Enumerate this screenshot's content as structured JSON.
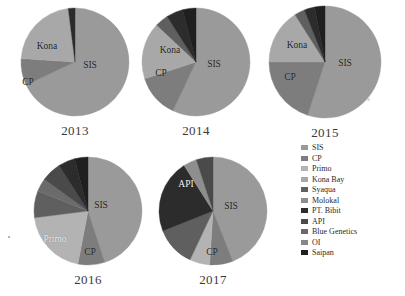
{
  "figure": {
    "kind": "pie-chart-panel",
    "background": "#ffffff"
  },
  "legend": {
    "position": "right",
    "items": [
      {
        "label": "SIS",
        "color": "#9a9a9a"
      },
      {
        "label": "CP",
        "color": "#7d7d7d"
      },
      {
        "label": "Primo",
        "color": "#b3b3b3"
      },
      {
        "label": "Kona Bay",
        "color": "#a8a8a8"
      },
      {
        "label": "Syaqua",
        "color": "#5f5f5f"
      },
      {
        "label": "Molokal",
        "color": "#8e8e8e"
      },
      {
        "label": "PT. Bibit",
        "color": "#2c2c2c"
      },
      {
        "label": "API",
        "color": "#4a4a4a"
      },
      {
        "label": "Blue Genetics",
        "color": "#6b6b6b"
      },
      {
        "label": "OI",
        "color": "#868686"
      },
      {
        "label": "Saipan",
        "color": "#1f1f1f"
      }
    ]
  },
  "chart_data": [
    {
      "type": "pie",
      "title": "2013",
      "categories": [
        "SIS",
        "CP",
        "Primo",
        "Kona Bay",
        "Syaqua",
        "Molokal",
        "PT. Bibit",
        "API",
        "Blue Genetics",
        "OI",
        "Saipan"
      ],
      "values": [
        68,
        8,
        0,
        22,
        0,
        0,
        2,
        0,
        0,
        0,
        0
      ],
      "unit": "percent",
      "labels_shown": [
        "SIS",
        "Kona",
        "CP"
      ],
      "legend": "shared"
    },
    {
      "type": "pie",
      "title": "2014",
      "categories": [
        "SIS",
        "CP",
        "Primo",
        "Kona Bay",
        "Syaqua",
        "Molokal",
        "PT. Bibit",
        "API",
        "Blue Genetics",
        "OI",
        "Saipan"
      ],
      "values": [
        57,
        13,
        0,
        17,
        4,
        0,
        5,
        0,
        0,
        0,
        4
      ],
      "unit": "percent",
      "labels_shown": [
        "SIS",
        "Kona",
        "CP"
      ],
      "legend": "shared"
    },
    {
      "type": "pie",
      "title": "2015",
      "categories": [
        "SIS",
        "CP",
        "Primo",
        "Kona Bay",
        "Syaqua",
        "Molokal",
        "PT. Bibit",
        "API",
        "Blue Genetics",
        "OI",
        "Saipan"
      ],
      "values": [
        55,
        20,
        0,
        16,
        3,
        0,
        3,
        0,
        0,
        0,
        3
      ],
      "unit": "percent",
      "labels_shown": [
        "SIS",
        "Kona",
        "CP"
      ],
      "legend": "shared"
    },
    {
      "type": "pie",
      "title": "2016",
      "categories": [
        "SIS",
        "CP",
        "Primo",
        "Kona Bay",
        "Syaqua",
        "Molokal",
        "PT. Bibit",
        "API",
        "Blue Genetics",
        "OI",
        "Saipan"
      ],
      "values": [
        45,
        8,
        20,
        0,
        8,
        0,
        5,
        6,
        4,
        0,
        4
      ],
      "unit": "percent",
      "labels_shown": [
        "SIS",
        "Primo",
        "CP"
      ],
      "legend": "shared"
    },
    {
      "type": "pie",
      "title": "2017",
      "categories": [
        "SIS",
        "CP",
        "Primo",
        "Kona Bay",
        "Syaqua",
        "Molokal",
        "PT. Bibit",
        "API",
        "Blue Genetics",
        "OI",
        "Saipan"
      ],
      "values": [
        44,
        7,
        6,
        0,
        12,
        0,
        4,
        22,
        0,
        0,
        5
      ],
      "unit": "percent",
      "labels_shown": [
        "SIS",
        "API",
        "CP"
      ],
      "legend": "shared"
    }
  ],
  "panels": [
    {
      "year": "2013",
      "cx": 75,
      "cy": 62,
      "r": 54,
      "start_angle": -90,
      "slices": [
        {
          "name": "SIS",
          "value": 68,
          "color": "#9a9a9a"
        },
        {
          "name": "CP",
          "value": 8,
          "color": "#7d7d7d"
        },
        {
          "name": "Kona Bay",
          "value": 22,
          "color": "#a8a8a8"
        },
        {
          "name": "PT. Bibit",
          "value": 2,
          "color": "#2c2c2c"
        }
      ],
      "annotations": [
        {
          "text": "SIS",
          "x": 90,
          "y": 65,
          "tone": "dark"
        },
        {
          "text": "Kona",
          "x": 47,
          "y": 46,
          "tone": "dark"
        },
        {
          "text": "CP",
          "x": 28,
          "y": 82,
          "tone": "dark"
        }
      ]
    },
    {
      "year": "2014",
      "cx": 196,
      "cy": 62,
      "r": 54,
      "start_angle": -90,
      "slices": [
        {
          "name": "SIS",
          "value": 57,
          "color": "#9a9a9a"
        },
        {
          "name": "CP",
          "value": 13,
          "color": "#7d7d7d"
        },
        {
          "name": "Kona Bay",
          "value": 17,
          "color": "#a8a8a8"
        },
        {
          "name": "Syaqua",
          "value": 4,
          "color": "#5f5f5f"
        },
        {
          "name": "PT. Bibit",
          "value": 5,
          "color": "#2c2c2c"
        },
        {
          "name": "Saipan",
          "value": 4,
          "color": "#1f1f1f"
        }
      ],
      "annotations": [
        {
          "text": "SIS",
          "x": 214,
          "y": 64,
          "tone": "dark"
        },
        {
          "text": "Kona",
          "x": 170,
          "y": 50,
          "tone": "dark"
        },
        {
          "text": "CP",
          "x": 161,
          "y": 73,
          "tone": "dark"
        }
      ]
    },
    {
      "year": "2015",
      "cx": 325,
      "cy": 62,
      "r": 56,
      "start_angle": -90,
      "slices": [
        {
          "name": "SIS",
          "value": 55,
          "color": "#9a9a9a"
        },
        {
          "name": "CP",
          "value": 20,
          "color": "#7d7d7d"
        },
        {
          "name": "Kona Bay",
          "value": 16,
          "color": "#a8a8a8"
        },
        {
          "name": "Syaqua",
          "value": 3,
          "color": "#5f5f5f"
        },
        {
          "name": "PT. Bibit",
          "value": 3,
          "color": "#2c2c2c"
        },
        {
          "name": "Saipan",
          "value": 3,
          "color": "#1f1f1f"
        }
      ],
      "annotations": [
        {
          "text": "SIS",
          "x": 345,
          "y": 63,
          "tone": "dark"
        },
        {
          "text": "Kona",
          "x": 297,
          "y": 45,
          "tone": "dark"
        },
        {
          "text": "CP",
          "x": 290,
          "y": 77,
          "tone": "dark"
        }
      ]
    },
    {
      "year": "2016",
      "cx": 88,
      "cy": 211,
      "r": 54,
      "start_angle": -90,
      "slices": [
        {
          "name": "SIS",
          "value": 45,
          "color": "#9a9a9a"
        },
        {
          "name": "CP",
          "value": 8,
          "color": "#7d7d7d"
        },
        {
          "name": "Primo",
          "value": 20,
          "color": "#b3b3b3"
        },
        {
          "name": "Syaqua",
          "value": 8,
          "color": "#5f5f5f"
        },
        {
          "name": "Blue Genetics",
          "value": 4,
          "color": "#6b6b6b"
        },
        {
          "name": "API",
          "value": 6,
          "color": "#4a4a4a"
        },
        {
          "name": "PT. Bibit",
          "value": 5,
          "color": "#2c2c2c"
        },
        {
          "name": "Saipan",
          "value": 4,
          "color": "#1f1f1f"
        }
      ],
      "annotations": [
        {
          "text": "SIS",
          "x": 101,
          "y": 205,
          "tone": "dark"
        },
        {
          "text": "Primo",
          "x": 55,
          "y": 239,
          "tone": "light"
        },
        {
          "text": "CP",
          "x": 90,
          "y": 252,
          "tone": "dark"
        }
      ]
    },
    {
      "year": "2017",
      "cx": 213,
      "cy": 211,
      "r": 54,
      "start_angle": -90,
      "slices": [
        {
          "name": "SIS",
          "value": 44,
          "color": "#9a9a9a"
        },
        {
          "name": "CP",
          "value": 7,
          "color": "#7d7d7d"
        },
        {
          "name": "Primo",
          "value": 6,
          "color": "#b3b3b3"
        },
        {
          "name": "Syaqua",
          "value": 12,
          "color": "#5f5f5f"
        },
        {
          "name": "API",
          "value": 22,
          "color": "#2c2c2c"
        },
        {
          "name": "Molokal",
          "value": 4,
          "color": "#8e8e8e"
        },
        {
          "name": "Saipan",
          "value": 5,
          "color": "#4a4a4a"
        }
      ],
      "annotations": [
        {
          "text": "SIS",
          "x": 231,
          "y": 206,
          "tone": "dark"
        },
        {
          "text": "API",
          "x": 186,
          "y": 184,
          "tone": "light"
        },
        {
          "text": "CP",
          "x": 212,
          "y": 252,
          "tone": "dark"
        }
      ]
    }
  ]
}
